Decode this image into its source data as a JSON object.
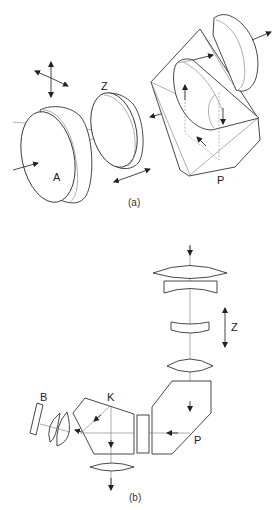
{
  "figure_a": {
    "caption": "(a)",
    "labels": {
      "aperture": "A",
      "zoom": "Z",
      "prism": "P"
    }
  },
  "figure_b": {
    "caption": "(b)",
    "labels": {
      "zoom": "Z",
      "prism": "P",
      "prism_k": "K",
      "element_b": "B"
    }
  },
  "colors": {
    "line": "#333333",
    "light_line": "#777777",
    "background": "#ffffff"
  }
}
